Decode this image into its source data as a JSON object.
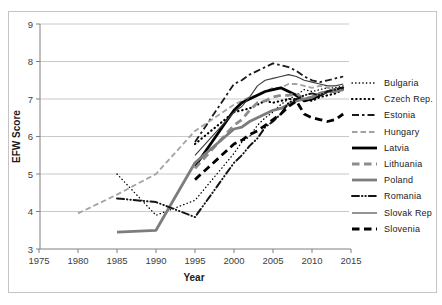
{
  "figure": {
    "background": "#ffffff",
    "border_color": "#c4c4c4",
    "grid_color": "#c8c8c8",
    "axis_color": "#808080",
    "tick_label_color": "#404040"
  },
  "chart_data": {
    "type": "line",
    "title": "",
    "xlabel": "Year",
    "ylabel": "EFW Score",
    "xlim": [
      1975,
      2015
    ],
    "ylim": [
      3,
      9
    ],
    "x_ticks": [
      1975,
      1980,
      1985,
      1990,
      1995,
      2000,
      2005,
      2010,
      2015
    ],
    "y_ticks": [
      3,
      4,
      5,
      6,
      7,
      8,
      9
    ],
    "grid": "horizontal-only",
    "legend_position": "right-outside",
    "series": [
      {
        "name": "Bulgaria",
        "color": "#000000",
        "line_style": "fine-dotted",
        "points": [
          [
            1985,
            5.0
          ],
          [
            1990,
            3.9
          ],
          [
            1995,
            4.3
          ],
          [
            2000,
            5.55
          ],
          [
            2001,
            5.85
          ],
          [
            2002,
            6.0
          ],
          [
            2003,
            6.3
          ],
          [
            2004,
            6.5
          ],
          [
            2005,
            6.65
          ],
          [
            2006,
            6.85
          ],
          [
            2007,
            7.0
          ],
          [
            2008,
            7.1
          ],
          [
            2009,
            7.25
          ],
          [
            2010,
            7.2
          ],
          [
            2011,
            7.25
          ],
          [
            2012,
            7.3
          ],
          [
            2013,
            7.3
          ],
          [
            2014,
            7.35
          ]
        ]
      },
      {
        "name": "Czech Rep.",
        "color": "#000000",
        "line_style": "bold-dotted",
        "points": [
          [
            1995,
            5.8
          ],
          [
            2000,
            6.65
          ],
          [
            2001,
            6.7
          ],
          [
            2002,
            6.75
          ],
          [
            2003,
            6.85
          ],
          [
            2004,
            6.95
          ],
          [
            2005,
            6.9
          ],
          [
            2006,
            6.95
          ],
          [
            2007,
            7.0
          ],
          [
            2008,
            7.0
          ],
          [
            2009,
            7.0
          ],
          [
            2010,
            6.95
          ],
          [
            2011,
            7.05
          ],
          [
            2012,
            7.1
          ],
          [
            2013,
            7.15
          ],
          [
            2014,
            7.25
          ]
        ]
      },
      {
        "name": "Estonia",
        "color": "#1a1a1a",
        "line_style": "dash-short-dash",
        "points": [
          [
            1995,
            5.85
          ],
          [
            2000,
            7.4
          ],
          [
            2001,
            7.5
          ],
          [
            2002,
            7.65
          ],
          [
            2003,
            7.75
          ],
          [
            2004,
            7.85
          ],
          [
            2005,
            7.95
          ],
          [
            2006,
            7.9
          ],
          [
            2007,
            7.85
          ],
          [
            2008,
            7.75
          ],
          [
            2009,
            7.6
          ],
          [
            2010,
            7.5
          ],
          [
            2011,
            7.45
          ],
          [
            2012,
            7.5
          ],
          [
            2013,
            7.55
          ],
          [
            2014,
            7.6
          ]
        ]
      },
      {
        "name": "Hungary",
        "color": "#a3a3a3",
        "line_style": "dashed",
        "points": [
          [
            1980,
            3.95
          ],
          [
            1985,
            4.45
          ],
          [
            1990,
            5.0
          ],
          [
            1995,
            6.15
          ],
          [
            2000,
            6.85
          ],
          [
            2001,
            6.95
          ],
          [
            2002,
            7.05
          ],
          [
            2003,
            7.1
          ],
          [
            2004,
            7.2
          ],
          [
            2005,
            7.3
          ],
          [
            2006,
            7.3
          ],
          [
            2007,
            7.4
          ],
          [
            2008,
            7.4
          ],
          [
            2009,
            7.35
          ],
          [
            2010,
            7.3
          ],
          [
            2011,
            7.35
          ],
          [
            2012,
            7.3
          ],
          [
            2013,
            7.25
          ],
          [
            2014,
            7.3
          ]
        ]
      },
      {
        "name": "Latvia",
        "color": "#000000",
        "line_style": "solid-thick",
        "points": [
          [
            1995,
            5.2
          ],
          [
            2000,
            6.7
          ],
          [
            2001,
            6.9
          ],
          [
            2002,
            7.0
          ],
          [
            2003,
            7.1
          ],
          [
            2004,
            7.2
          ],
          [
            2005,
            7.25
          ],
          [
            2006,
            7.3
          ],
          [
            2007,
            7.2
          ],
          [
            2008,
            7.1
          ],
          [
            2009,
            6.95
          ],
          [
            2010,
            7.0
          ],
          [
            2011,
            7.1
          ],
          [
            2012,
            7.2
          ],
          [
            2013,
            7.25
          ],
          [
            2014,
            7.3
          ]
        ]
      },
      {
        "name": "Lithuania",
        "color": "#8c8c8c",
        "line_style": "thick-dashed",
        "points": [
          [
            1995,
            5.15
          ],
          [
            2000,
            6.3
          ],
          [
            2001,
            6.45
          ],
          [
            2002,
            6.7
          ],
          [
            2003,
            6.9
          ],
          [
            2004,
            6.95
          ],
          [
            2005,
            7.05
          ],
          [
            2006,
            7.1
          ],
          [
            2007,
            7.1
          ],
          [
            2008,
            7.15
          ],
          [
            2009,
            7.0
          ],
          [
            2010,
            7.05
          ],
          [
            2011,
            7.15
          ],
          [
            2012,
            7.2
          ],
          [
            2013,
            7.25
          ],
          [
            2014,
            7.3
          ]
        ]
      },
      {
        "name": "Poland",
        "color": "#7d7d7d",
        "line_style": "solid-thick",
        "points": [
          [
            1985,
            3.45
          ],
          [
            1990,
            3.5
          ],
          [
            1995,
            5.3
          ],
          [
            2000,
            6.2
          ],
          [
            2001,
            6.25
          ],
          [
            2002,
            6.4
          ],
          [
            2003,
            6.5
          ],
          [
            2004,
            6.6
          ],
          [
            2005,
            6.7
          ],
          [
            2006,
            6.75
          ],
          [
            2007,
            6.85
          ],
          [
            2008,
            6.95
          ],
          [
            2009,
            7.0
          ],
          [
            2010,
            7.05
          ],
          [
            2011,
            7.15
          ],
          [
            2012,
            7.2
          ],
          [
            2013,
            7.2
          ],
          [
            2014,
            7.25
          ]
        ]
      },
      {
        "name": "Romania",
        "color": "#141414",
        "line_style": "dash-dot-dot",
        "points": [
          [
            1985,
            4.35
          ],
          [
            1990,
            4.25
          ],
          [
            1995,
            3.85
          ],
          [
            2000,
            5.3
          ],
          [
            2001,
            5.5
          ],
          [
            2002,
            5.75
          ],
          [
            2003,
            5.95
          ],
          [
            2004,
            6.25
          ],
          [
            2005,
            6.4
          ],
          [
            2006,
            6.6
          ],
          [
            2007,
            6.9
          ],
          [
            2008,
            7.0
          ],
          [
            2009,
            7.1
          ],
          [
            2010,
            7.15
          ],
          [
            2011,
            7.1
          ],
          [
            2012,
            7.2
          ],
          [
            2013,
            7.25
          ],
          [
            2014,
            7.3
          ]
        ]
      },
      {
        "name": "Slovak Rep",
        "color": "#3d3d3d",
        "line_style": "solid-thin",
        "points": [
          [
            1995,
            5.5
          ],
          [
            2000,
            6.65
          ],
          [
            2001,
            6.8
          ],
          [
            2002,
            7.05
          ],
          [
            2003,
            7.35
          ],
          [
            2004,
            7.5
          ],
          [
            2005,
            7.55
          ],
          [
            2006,
            7.6
          ],
          [
            2007,
            7.65
          ],
          [
            2008,
            7.6
          ],
          [
            2009,
            7.5
          ],
          [
            2010,
            7.45
          ],
          [
            2011,
            7.4
          ],
          [
            2012,
            7.35
          ],
          [
            2013,
            7.35
          ],
          [
            2014,
            7.4
          ]
        ]
      },
      {
        "name": "Slovenia",
        "color": "#000000",
        "line_style": "thick-dashed",
        "points": [
          [
            1995,
            4.85
          ],
          [
            2000,
            5.8
          ],
          [
            2001,
            5.9
          ],
          [
            2002,
            6.05
          ],
          [
            2003,
            6.15
          ],
          [
            2004,
            6.3
          ],
          [
            2005,
            6.45
          ],
          [
            2006,
            6.6
          ],
          [
            2007,
            6.8
          ],
          [
            2008,
            6.95
          ],
          [
            2009,
            6.6
          ],
          [
            2010,
            6.5
          ],
          [
            2011,
            6.45
          ],
          [
            2012,
            6.4
          ],
          [
            2013,
            6.45
          ],
          [
            2014,
            6.6
          ]
        ]
      }
    ]
  }
}
